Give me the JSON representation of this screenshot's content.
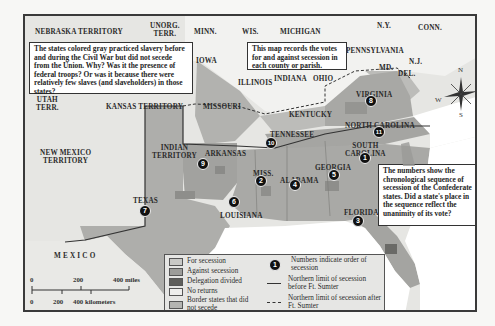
{
  "map": {
    "title": "Secession vote map",
    "regions": [
      {
        "name": "NEBRASKA TERRITORY",
        "x": 33,
        "y": 26
      },
      {
        "name": "UNORG.\nTERR.",
        "x": 148,
        "y": 20
      },
      {
        "name": "MINN.",
        "x": 192,
        "y": 26
      },
      {
        "name": "WIS.",
        "x": 240,
        "y": 26
      },
      {
        "name": "MICHIGAN",
        "x": 278,
        "y": 26
      },
      {
        "name": "N.Y.",
        "x": 375,
        "y": 20
      },
      {
        "name": "CONN.",
        "x": 416,
        "y": 22
      },
      {
        "name": "IOWA",
        "x": 194,
        "y": 55
      },
      {
        "name": "PENNSYLVANIA",
        "x": 344,
        "y": 45
      },
      {
        "name": "N.J.",
        "x": 407,
        "y": 56
      },
      {
        "name": "MD.",
        "x": 377,
        "y": 62
      },
      {
        "name": "DEL.",
        "x": 396,
        "y": 68
      },
      {
        "name": "ILLINOIS",
        "x": 236,
        "y": 77
      },
      {
        "name": "INDIANA",
        "x": 272,
        "y": 73
      },
      {
        "name": "OHIO",
        "x": 311,
        "y": 73
      },
      {
        "name": "UTAH\nTERR.",
        "x": 34,
        "y": 94
      },
      {
        "name": "KANSAS TERRITORY",
        "x": 104,
        "y": 101
      },
      {
        "name": "MISSOURI",
        "x": 201,
        "y": 101
      },
      {
        "name": "VIRGINIA",
        "x": 354,
        "y": 89
      },
      {
        "name": "KENTUCKY",
        "x": 287,
        "y": 109
      },
      {
        "name": "NORTH CAROLINA",
        "x": 343,
        "y": 120
      },
      {
        "name": "TENNESSEE",
        "x": 268,
        "y": 129
      },
      {
        "name": "NEW MEXICO\nTERRITORY",
        "x": 38,
        "y": 147
      },
      {
        "name": "INDIAN\nTERRITORY",
        "x": 150,
        "y": 142
      },
      {
        "name": "ARKANSAS",
        "x": 203,
        "y": 148
      },
      {
        "name": "SOUTH\nCAROLINA",
        "x": 343,
        "y": 140
      },
      {
        "name": "GEORGIA",
        "x": 313,
        "y": 162
      },
      {
        "name": "MISS.",
        "x": 251,
        "y": 168
      },
      {
        "name": "ALABAMA",
        "x": 278,
        "y": 175
      },
      {
        "name": "TEXAS",
        "x": 131,
        "y": 195
      },
      {
        "name": "LOUISIANA",
        "x": 218,
        "y": 210
      },
      {
        "name": "FLORIDA",
        "x": 342,
        "y": 207
      },
      {
        "name": "M E X I C O",
        "x": 52,
        "y": 250
      }
    ],
    "secession_order": [
      {
        "state": "South Carolina",
        "n": "1",
        "x": 362,
        "y": 155
      },
      {
        "state": "Mississippi",
        "n": "2",
        "x": 258,
        "y": 178
      },
      {
        "state": "Florida",
        "n": "3",
        "x": 355,
        "y": 218
      },
      {
        "state": "Alabama",
        "n": "4",
        "x": 292,
        "y": 182
      },
      {
        "state": "Georgia",
        "n": "5",
        "x": 331,
        "y": 172
      },
      {
        "state": "Louisiana",
        "n": "6",
        "x": 231,
        "y": 199
      },
      {
        "state": "Texas",
        "n": "7",
        "x": 142,
        "y": 208
      },
      {
        "state": "Virginia",
        "n": "8",
        "x": 368,
        "y": 98
      },
      {
        "state": "Arkansas",
        "n": "9",
        "x": 200,
        "y": 161
      },
      {
        "state": "Tennessee",
        "n": "10",
        "x": 268,
        "y": 140
      },
      {
        "state": "North Carolina",
        "n": "11",
        "x": 376,
        "y": 129
      }
    ]
  },
  "notes": {
    "gray_states": "The states colored gray practiced slavery before and during the Civil War but did not secede from the Union. Why? Was it the presence of federal troops? Or was it because there were relatively few slaves (and slaveholders) in those states?",
    "county_votes": "This map records the votes for and against secession in each county or parish.",
    "sequence": "The numbers show the chronological sequence of secession of the Confederate states. Did a state's place in the sequence reflect the unanimity of its vote?"
  },
  "legend": {
    "items": [
      {
        "label": "For secession",
        "color": "#c9c9c6"
      },
      {
        "label": "Against secession",
        "color": "#9d9d9a"
      },
      {
        "label": "Delegation divided",
        "color": "#5e5e5b"
      },
      {
        "label": "No returns",
        "color": "#eeeeec"
      },
      {
        "label": "Border states that did not secede",
        "color": "#b4b4b1"
      }
    ],
    "symbols": [
      {
        "symbol": "numbered-circle",
        "sample": "1",
        "label": "Numbers indicate order of secession"
      },
      {
        "symbol": "solid-line",
        "label": "Northern limit of secession before Ft. Sumter"
      },
      {
        "symbol": "dashed-line",
        "label": "Northern limit of secession after Ft. Sumter"
      }
    ]
  },
  "scale": {
    "miles": [
      "0",
      "200",
      "400 miles"
    ],
    "kilometers": [
      "0",
      "200",
      "400 kilometers"
    ]
  },
  "compass": {
    "n": "N",
    "s": "S",
    "e": "E",
    "w": "W"
  },
  "colors": {
    "seceded": "#a8a8a5",
    "border": "#b6b6b3",
    "north": "#f1f1ef",
    "territory": "#e4e4e1",
    "ocean": "#ffffff",
    "frame": "#3a3a3a"
  }
}
